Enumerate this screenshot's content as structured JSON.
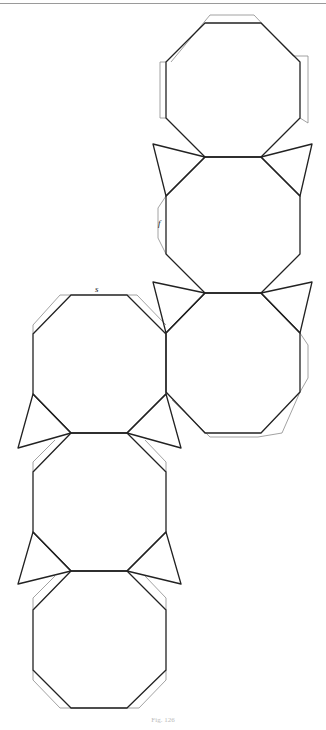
{
  "figure": {
    "caption": "Fig. 126",
    "labels": {
      "s": "s",
      "f": "f"
    },
    "colors": {
      "stroke": "#222222",
      "flap": "#8a8a8a",
      "rule": "#9a9a9a"
    }
  },
  "shapes": {
    "octagons": [
      {
        "id": "right-1",
        "points": "205,23 261,23 300,62 300,118 261,157 205,157 166,118 166,62"
      },
      {
        "id": "right-2",
        "points": "205,157 261,157 300,196 300,254 261,293 205,293 166,254 166,196"
      },
      {
        "id": "right-3",
        "points": "205,293 261,293 300,333 300,392 261,433 205,433 166,392 166,333"
      },
      {
        "id": "left-1",
        "points": "71,295 127,295 166,334 166,394 127,433 71,433 33,394 33,334"
      },
      {
        "id": "left-2",
        "points": "71,433 127,433 166,472 166,532 127,571 71,571 33,532 33,472"
      },
      {
        "id": "left-3",
        "points": "71,571 127,571 166,610 166,670 127,708 71,708 33,670 33,610"
      }
    ],
    "triangles": [
      {
        "id": "tri-r1-l",
        "points": "205,157 153,144 166,196"
      },
      {
        "id": "tri-r1-r",
        "points": "261,157 312,144 300,196"
      },
      {
        "id": "tri-r2-l",
        "points": "205,293 153,282 166,333"
      },
      {
        "id": "tri-r2-r",
        "points": "261,293 312,282 300,333"
      },
      {
        "id": "tri-l1-l",
        "points": "71,433 18,448 33,394"
      },
      {
        "id": "tri-l1-r",
        "points": "127,433 181,448 166,394"
      },
      {
        "id": "tri-l2-l",
        "points": "71,571 18,584 33,532"
      },
      {
        "id": "tri-l2-r",
        "points": "127,571 181,584 166,532"
      }
    ],
    "flaps": [
      {
        "id": "flap-r1-top",
        "points": "171,62 210,15 254,15 293,56 308,56 308,123 300,118"
      },
      {
        "id": "flap-r1-topleft",
        "points": "166,62 160,62 160,118 166,118"
      },
      {
        "id": "flap-r2-left",
        "points": "166,196 158,208 158,238 166,254"
      },
      {
        "id": "flap-r3-right",
        "points": "300,333 308,345 308,378 300,392"
      },
      {
        "id": "flap-r3-bottom",
        "points": "300,392 282,433 258,437 210,437 172,400"
      },
      {
        "id": "flap-l1-top",
        "points": "33,334 33,325 60,295 71,295"
      },
      {
        "id": "flap-l1-topright",
        "points": "127,295 137,295 166,325"
      },
      {
        "id": "flap-l2-top-l",
        "points": "33,472 33,462 55,440"
      },
      {
        "id": "flap-l2-top-r",
        "points": "166,472 166,462 145,440"
      },
      {
        "id": "flap-l3-top-l",
        "points": "33,610 33,598 55,576"
      },
      {
        "id": "flap-l3-top-r",
        "points": "166,610 166,598 145,576"
      },
      {
        "id": "flap-l3-bottom",
        "points": "33,670 33,680 60,708 139,708 166,680 166,670"
      }
    ]
  }
}
